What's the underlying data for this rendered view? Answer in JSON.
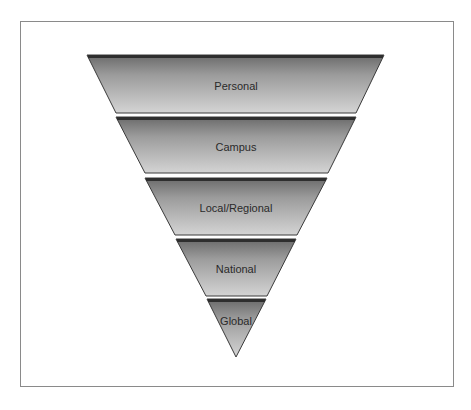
{
  "diagram": {
    "type": "inverted-pyramid",
    "levels": [
      {
        "label": "Personal"
      },
      {
        "label": "Campus"
      },
      {
        "label": "Local/Regional"
      },
      {
        "label": "National"
      },
      {
        "label": "Global"
      }
    ]
  },
  "colors": {
    "band_top": "#6f6f6f",
    "band_bottom": "#d2d2d2",
    "edge": "#3a3a3a",
    "frame": "#8a8a8a"
  }
}
